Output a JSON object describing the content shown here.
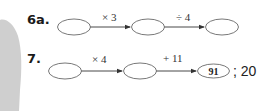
{
  "problems": [
    {
      "label": "6a.",
      "steps": [
        {
          "op": "× 3"
        },
        {
          "op": "÷ 4"
        }
      ],
      "boxes": [
        "",
        "",
        ""
      ]
    },
    {
      "label": "7.",
      "steps": [
        {
          "op": "× 4"
        },
        {
          "op": "+ 11"
        }
      ],
      "boxes": [
        "",
        "",
        "91"
      ],
      "answer": "; 20"
    }
  ],
  "colors": {
    "background": "#ffffff",
    "shadow": "#c8c8c8",
    "ink": "#222222"
  }
}
